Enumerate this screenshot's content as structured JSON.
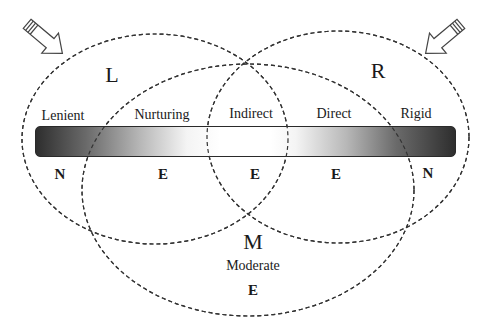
{
  "diagram": {
    "sets": [
      {
        "id": "L",
        "label": "L"
      },
      {
        "id": "R",
        "label": "R"
      },
      {
        "id": "M",
        "label": "M",
        "sublabel": "Moderate",
        "code": "E"
      }
    ],
    "spectrum": {
      "labels": [
        "Lenient",
        "Nurturing",
        "Indirect",
        "Direct",
        "Rigid"
      ],
      "codes": [
        "N",
        "E",
        "E",
        "E",
        "N"
      ],
      "gradient": "dark-to-light-to-dark"
    },
    "arrows": [
      {
        "position": "top-left",
        "direction": "down-right"
      },
      {
        "position": "top-right",
        "direction": "down-left"
      }
    ],
    "colors": {
      "outline": "#333333",
      "bar_dark": "#2e2e2e",
      "bar_light": "#ffffff",
      "background": "#ffffff"
    }
  }
}
